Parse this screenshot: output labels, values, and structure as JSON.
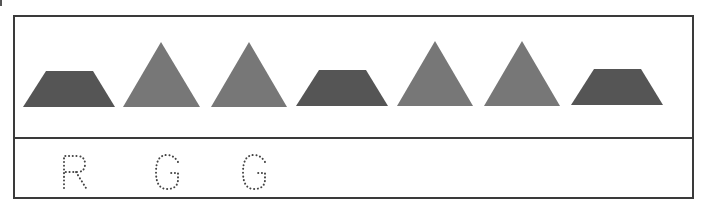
{
  "worksheet": {
    "pattern": [
      {
        "shape": "trapezoid",
        "color": "#555555"
      },
      {
        "shape": "triangle",
        "color": "#777777"
      },
      {
        "shape": "triangle",
        "color": "#777777"
      },
      {
        "shape": "trapezoid",
        "color": "#555555"
      },
      {
        "shape": "triangle",
        "color": "#777777"
      },
      {
        "shape": "triangle",
        "color": "#777777"
      },
      {
        "shape": "trapezoid",
        "color": "#555555"
      }
    ],
    "answers": [
      {
        "letter": "R",
        "style": "dotted-trace"
      },
      {
        "letter": "G",
        "style": "dotted-trace"
      },
      {
        "letter": "G",
        "style": "dotted-trace"
      }
    ]
  }
}
